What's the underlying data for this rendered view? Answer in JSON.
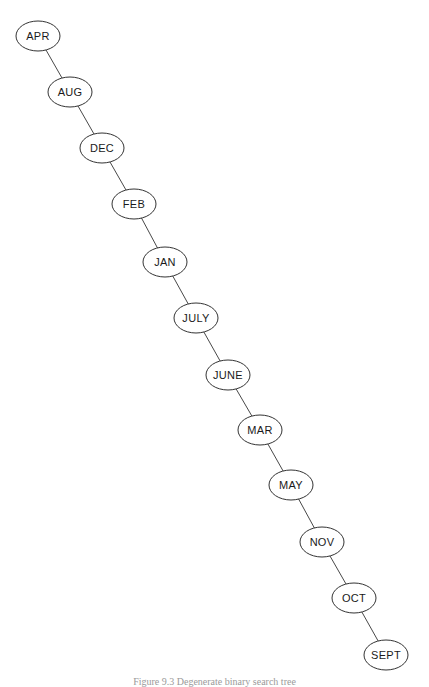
{
  "figure": {
    "type": "binary-search-tree",
    "caption": "Figure 9.3  Degenerate binary search tree",
    "colors": {
      "stroke": "#333333",
      "fill": "#ffffff",
      "text": "#1a1a1a"
    },
    "node_rx": 22,
    "node_ry": 15,
    "nodes": [
      {
        "label": "APR",
        "cx": 38,
        "cy": 36
      },
      {
        "label": "AUG",
        "cx": 70,
        "cy": 92
      },
      {
        "label": "DEC",
        "cx": 102,
        "cy": 148
      },
      {
        "label": "FEB",
        "cx": 134,
        "cy": 204
      },
      {
        "label": "JAN",
        "cx": 165,
        "cy": 262
      },
      {
        "label": "JULY",
        "cx": 196,
        "cy": 318
      },
      {
        "label": "JUNE",
        "cx": 228,
        "cy": 375
      },
      {
        "label": "MAR",
        "cx": 260,
        "cy": 430
      },
      {
        "label": "MAY",
        "cx": 291,
        "cy": 485
      },
      {
        "label": "NOV",
        "cx": 322,
        "cy": 542
      },
      {
        "label": "OCT",
        "cx": 354,
        "cy": 598
      },
      {
        "label": "SEPT",
        "cx": 386,
        "cy": 655
      }
    ],
    "edges": [
      [
        "APR",
        "AUG"
      ],
      [
        "AUG",
        "DEC"
      ],
      [
        "DEC",
        "FEB"
      ],
      [
        "FEB",
        "JAN"
      ],
      [
        "JAN",
        "JULY"
      ],
      [
        "JULY",
        "JUNE"
      ],
      [
        "JUNE",
        "MAR"
      ],
      [
        "MAR",
        "MAY"
      ],
      [
        "MAY",
        "NOV"
      ],
      [
        "NOV",
        "OCT"
      ],
      [
        "OCT",
        "SEPT"
      ]
    ]
  }
}
